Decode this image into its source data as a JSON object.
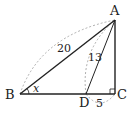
{
  "diagram": {
    "type": "right-triangle-geometry",
    "points": {
      "A": {
        "label": "A",
        "x": 115,
        "y": 20
      },
      "B": {
        "label": "B",
        "x": 20,
        "y": 94
      },
      "C": {
        "label": "C",
        "x": 115,
        "y": 94
      },
      "D": {
        "label": "D",
        "x": 86,
        "y": 94
      }
    },
    "segments": [
      "AB",
      "AC",
      "BC",
      "AD"
    ],
    "right_angle_at": "C",
    "measures": {
      "AB": "20",
      "AD": "13",
      "DC": "5",
      "angle_B": "x"
    },
    "colors": {
      "line": "#222222",
      "dashed_arc": "#9a9a9a"
    }
  }
}
